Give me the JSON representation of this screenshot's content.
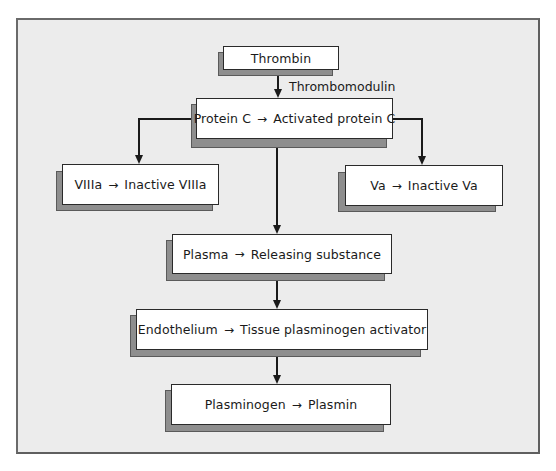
{
  "diagram": {
    "type": "flowchart",
    "colors": {
      "panel_fill": "#ececec",
      "panel_border": "#5f5f5f",
      "box_fill": "#ffffff",
      "box_shadow": "#8e8e8e",
      "line": "#1a1a1a"
    },
    "nodes": {
      "thrombin": {
        "text": "Thrombin"
      },
      "protein_c": {
        "left": "Protein C",
        "arrow": "→",
        "right": "Activated protein C"
      },
      "viiia": {
        "left": "VIIIa",
        "arrow": "→",
        "right": "Inactive VIIIa"
      },
      "va": {
        "left": "Va",
        "arrow": "→",
        "right": "Inactive Va"
      },
      "plasma": {
        "left": "Plasma",
        "arrow": "→",
        "right": "Releasing substance"
      },
      "endothelium": {
        "left": "Endothelium",
        "arrow": "→",
        "right": "Tissue plasminogen activator"
      },
      "plasminogen": {
        "left": "Plasminogen",
        "arrow": "→",
        "right": "Plasmin"
      }
    },
    "edge_labels": {
      "thrombin_to_protein_c": "Thrombomodulin"
    },
    "edges": [
      {
        "from": "Thrombin",
        "to": "Protein C → Activated protein C",
        "label": "Thrombomodulin"
      },
      {
        "from": "Protein C → Activated protein C",
        "to": "VIIIa → Inactive VIIIa"
      },
      {
        "from": "Protein C → Activated protein C",
        "to": "Va → Inactive Va"
      },
      {
        "from": "Protein C → Activated protein C",
        "to": "Plasma → Releasing substance"
      },
      {
        "from": "Plasma → Releasing substance",
        "to": "Endothelium → Tissue plasminogen activator"
      },
      {
        "from": "Endothelium → Tissue plasminogen activator",
        "to": "Plasminogen → Plasmin"
      }
    ]
  }
}
